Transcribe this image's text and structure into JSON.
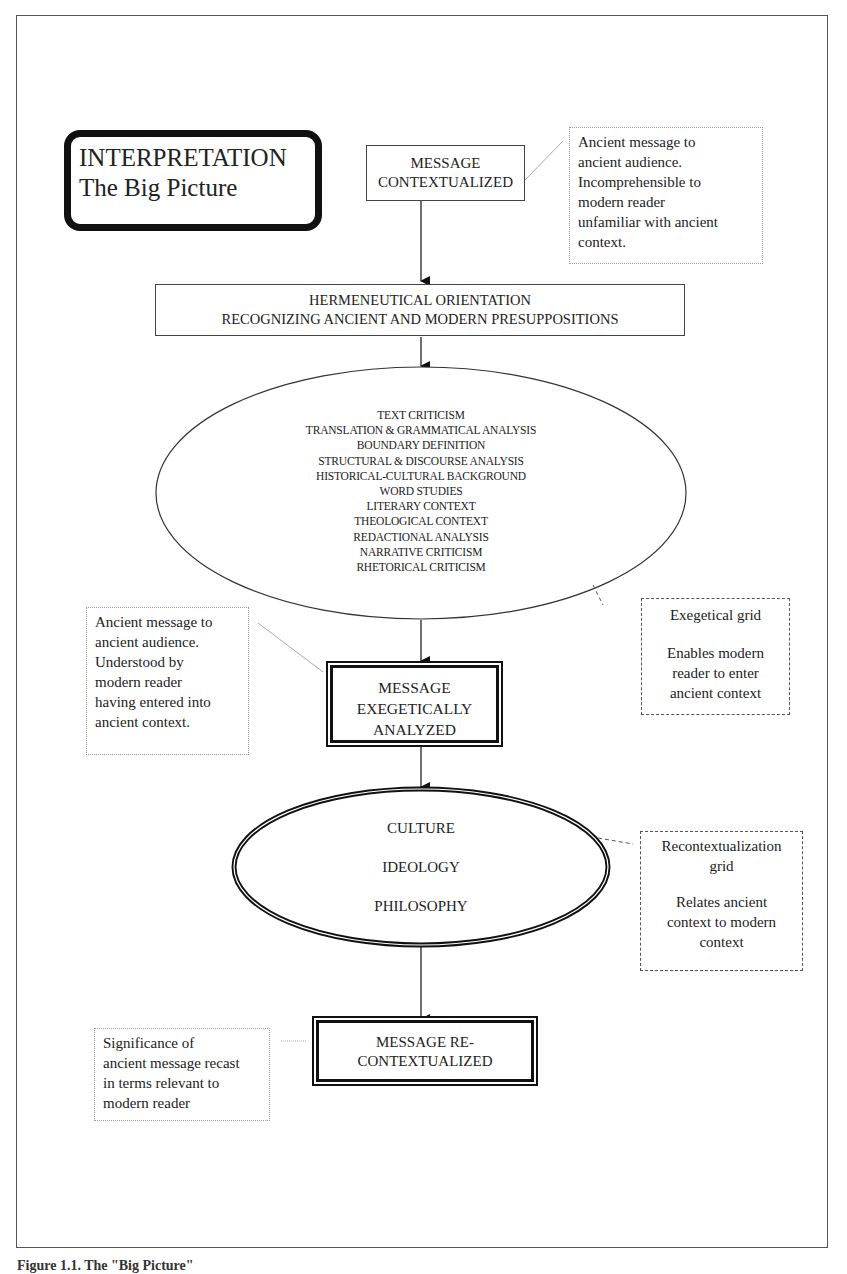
{
  "diagram": {
    "title": {
      "line1": "INTERPRETATION",
      "line2": "The Big Picture"
    },
    "nodes": {
      "message_contextualized": {
        "line1": "MESSAGE",
        "line2": "CONTEXTUALIZED"
      },
      "hermeneutical_orientation": {
        "line1": "HERMENEUTICAL ORIENTATION",
        "line2": "RECOGNIZING ANCIENT AND MODERN PRESUPPOSITIONS"
      },
      "exegetical_grid_items": [
        "TEXT CRITICISM",
        "TRANSLATION & GRAMMATICAL ANALYSIS",
        "BOUNDARY DEFINITION",
        "STRUCTURAL & DISCOURSE ANALYSIS",
        "HISTORICAL-CULTURAL BACKGROUND",
        "WORD STUDIES",
        "LITERARY CONTEXT",
        "THEOLOGICAL CONTEXT",
        "REDACTIONAL ANALYSIS",
        "NARRATIVE CRITICISM",
        "RHETORICAL CRITICISM"
      ],
      "message_exegetically_analyzed": {
        "line1": "MESSAGE",
        "line2": "EXEGETICALLY",
        "line3": "ANALYZED"
      },
      "recontextualization_grid_items": [
        "CULTURE",
        "IDEOLOGY",
        "PHILOSOPHY"
      ],
      "message_recontextualized": {
        "line1": "MESSAGE RE-",
        "line2": "CONTEXTUALIZED"
      }
    },
    "notes": {
      "contextualized_note": [
        "Ancient message to",
        "ancient audience.",
        "Incomprehensible to",
        "modern reader",
        "unfamiliar with ancient",
        "context."
      ],
      "exegetical_grid_note": {
        "title": "Exegetical grid",
        "body": [
          "Enables modern",
          "reader to enter",
          "ancient context"
        ]
      },
      "analyzed_note": [
        "Ancient message to",
        "ancient audience.",
        "Understood by",
        "modern reader",
        "having entered into",
        "ancient context."
      ],
      "recontextualization_grid_note": {
        "title": [
          "Recontextualization",
          "grid"
        ],
        "body": [
          "Relates ancient",
          "context to modern",
          "context"
        ]
      },
      "recontextualized_note": [
        "Significance of",
        "ancient message recast",
        "in terms relevant to",
        "modern reader"
      ]
    },
    "caption": "Figure 1.1. The \"Big Picture\""
  }
}
